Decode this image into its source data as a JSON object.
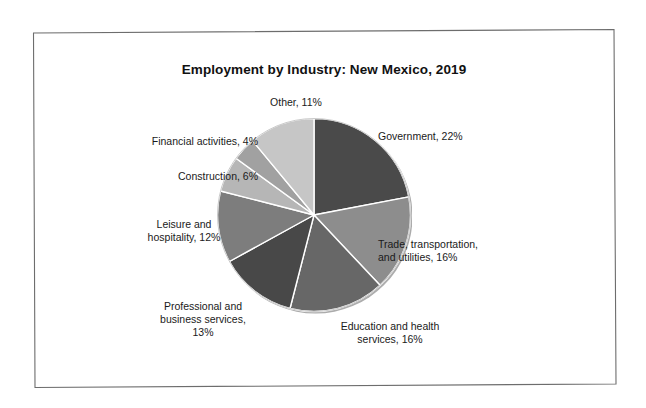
{
  "chart_data": {
    "type": "pie",
    "title": "Employment by Industry: New Mexico, 2019",
    "subtitle": "",
    "xlabel": "",
    "ylabel": "",
    "grid": false,
    "legend_position": "none",
    "label_format": "{category}, {value}%",
    "units": "percent",
    "total": 100,
    "start_angle_deg": 0,
    "direction": "clockwise",
    "categories": [
      "Government",
      "Trade, transportation, and utilities",
      "Education and health services",
      "Professional and business services",
      "Leisure and hospitality",
      "Construction",
      "Financial activities",
      "Other"
    ],
    "values": [
      22,
      16,
      16,
      13,
      12,
      6,
      4,
      11
    ],
    "slices": [
      {
        "category": "Government",
        "value": 22,
        "label": "Government, 22%",
        "color": "#4a4a4a"
      },
      {
        "category": "Trade, transportation, and utilities",
        "value": 16,
        "label": "Trade, transportation,\nand utilities, 16%",
        "color": "#8d8d8d"
      },
      {
        "category": "Education and health services",
        "value": 16,
        "label": "Education and health\nservices, 16%",
        "color": "#676767"
      },
      {
        "category": "Professional and business services",
        "value": 13,
        "label": "Professional and\nbusiness services,\n13%",
        "color": "#484848"
      },
      {
        "category": "Leisure and hospitality",
        "value": 12,
        "label": "Leisure and\nhospitality, 12%",
        "color": "#7d7d7d"
      },
      {
        "category": "Construction",
        "value": 6,
        "label": "Construction, 6%",
        "color": "#b6b6b6"
      },
      {
        "category": "Financial activities",
        "value": 4,
        "label": "Financial activities, 4%",
        "color": "#a1a1a1"
      },
      {
        "category": "Other",
        "value": 11,
        "label": "Other, 11%",
        "color": "#c6c6c6"
      }
    ]
  },
  "page": {
    "background_color": "#ffffff",
    "frame_color": "#6d6d6d",
    "text_color": "#1a1a1a",
    "title_color": "#111111",
    "slice_separator_color": "#ffffff"
  }
}
